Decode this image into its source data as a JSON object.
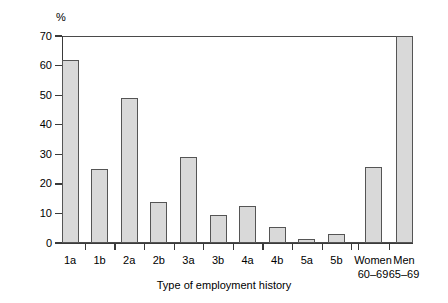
{
  "chart_data": {
    "type": "bar",
    "title": "",
    "xlabel": "Type of employment history",
    "ylabel": "%",
    "y_unit": "%",
    "ylim": [
      0,
      70
    ],
    "yticks": [
      0,
      10,
      20,
      30,
      40,
      50,
      60,
      70
    ],
    "ytick_labels": [
      "0",
      "10",
      "20",
      "30",
      "40",
      "50",
      "60",
      "70"
    ],
    "grid": false,
    "legend": null,
    "categories": [
      "1a",
      "1b",
      "2a",
      "2b",
      "3a",
      "3b",
      "4a",
      "4b",
      "5a",
      "5b",
      "Women 60–69",
      "Men 65–69"
    ],
    "category_labels": [
      {
        "line1": "1a",
        "line2": ""
      },
      {
        "line1": "1b",
        "line2": ""
      },
      {
        "line1": "2a",
        "line2": ""
      },
      {
        "line1": "2b",
        "line2": ""
      },
      {
        "line1": "3a",
        "line2": ""
      },
      {
        "line1": "3b",
        "line2": ""
      },
      {
        "line1": "4a",
        "line2": ""
      },
      {
        "line1": "4b",
        "line2": ""
      },
      {
        "line1": "5a",
        "line2": ""
      },
      {
        "line1": "5b",
        "line2": ""
      },
      {
        "line1": "Women",
        "line2": "60–69"
      },
      {
        "line1": "Men",
        "line2": "65–69"
      }
    ],
    "values": [
      62,
      25,
      49,
      14,
      29,
      9.3,
      12.5,
      5.3,
      1.5,
      3,
      25.8,
      70
    ],
    "colors": {
      "bar_fill": "#d9d9d9",
      "bar_stroke": "#555555",
      "axis": "#3a3a3a",
      "frame": "#4a4a4a",
      "text": "#000000",
      "background": "#ffffff"
    }
  }
}
